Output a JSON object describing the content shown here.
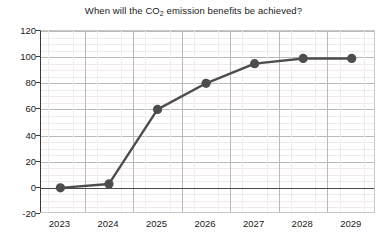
{
  "chart_data": {
    "type": "line",
    "title": "When will the CO2 emission benefits be achieved?",
    "title_parts": {
      "before": "When will the CO",
      "subscript": "2",
      "after": " emission benefits be achieved?"
    },
    "xlabel": "",
    "ylabel": "",
    "categories": [
      "2023",
      "2024",
      "2025",
      "2026",
      "2027",
      "2028",
      "2029"
    ],
    "x": [
      2023,
      2024,
      2025,
      2026,
      2027,
      2028,
      2029
    ],
    "values": [
      0,
      3,
      60,
      80,
      95,
      99,
      99
    ],
    "ylim": [
      -20,
      120
    ],
    "xlim": [
      2022.6,
      2029.5
    ],
    "y_ticks": [
      -20,
      0,
      20,
      40,
      60,
      80,
      100,
      120
    ],
    "y_tick_labels": [
      "-20",
      "0",
      "20",
      "40",
      "60",
      "80",
      "100",
      "120"
    ],
    "x_ticks": [
      2023,
      2024,
      2025,
      2026,
      2027,
      2028,
      2029
    ],
    "x_tick_labels": [
      "2023",
      "2024",
      "2025",
      "2026",
      "2027",
      "2028",
      "2029"
    ],
    "grid": true,
    "minor_grid": true,
    "legend": false,
    "legend_position": "none",
    "zero_reference_line": 0,
    "series": [
      {
        "name": "CO2 emission benefits",
        "values": [
          0,
          3,
          60,
          80,
          95,
          99,
          99
        ],
        "color": "#4d4d4d",
        "marker": "circle",
        "marker_size": 8,
        "line_width": 2.4
      }
    ],
    "colors": {
      "line": "#4d4d4d",
      "marker": "#4d4d4d",
      "grid_major": "#b9b9b9",
      "grid_minor": "#f0eaea",
      "axis": "#3a3a3a",
      "background": "#ffffff",
      "text": "#1a1a1a"
    }
  }
}
